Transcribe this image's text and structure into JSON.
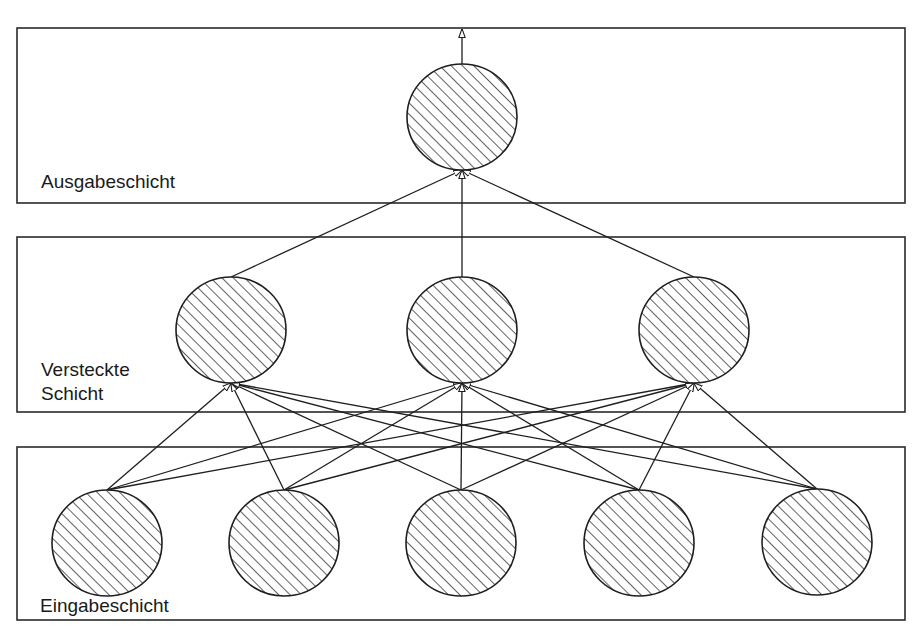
{
  "diagram": {
    "type": "neural-network",
    "colors": {
      "stroke": "#1e1e1e",
      "background": "#ffffff"
    },
    "layers": [
      {
        "id": "output",
        "label_lines": [
          "Ausgabeschicht"
        ],
        "box": {
          "x": 17,
          "y": 28,
          "w": 888,
          "h": 175
        },
        "label_pos": {
          "x": 41,
          "y": 170
        },
        "nodes": [
          {
            "cx": 462,
            "cy": 117
          }
        ]
      },
      {
        "id": "hidden",
        "label_lines": [
          "Versteckte",
          "Schicht"
        ],
        "box": {
          "x": 17,
          "y": 237,
          "w": 888,
          "h": 175
        },
        "label_pos": {
          "x": 41,
          "y": 358
        },
        "nodes": [
          {
            "cx": 231,
            "cy": 330
          },
          {
            "cx": 462,
            "cy": 330
          },
          {
            "cx": 694,
            "cy": 330
          }
        ]
      },
      {
        "id": "input",
        "label_lines": [
          "Eingabeschicht"
        ],
        "box": {
          "x": 17,
          "y": 447,
          "w": 888,
          "h": 173
        },
        "label_pos": {
          "x": 40,
          "y": 594
        },
        "nodes": [
          {
            "cx": 107,
            "cy": 543
          },
          {
            "cx": 284,
            "cy": 543
          },
          {
            "cx": 461,
            "cy": 543
          },
          {
            "cx": 639,
            "cy": 543
          },
          {
            "cx": 817,
            "cy": 542
          }
        ]
      }
    ],
    "node_radius": {
      "rx": 55,
      "ry": 53
    },
    "connections": "fully-connected input→hidden, hidden→output",
    "output_arrow": {
      "from_y": 64,
      "to_y": 29
    }
  }
}
